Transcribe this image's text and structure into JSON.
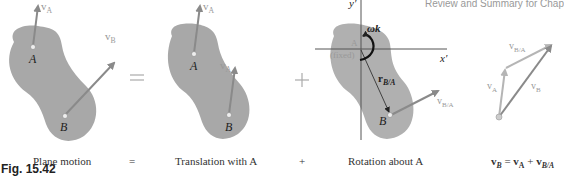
{
  "header": {
    "running_title": "Review and Summary for Chap"
  },
  "figure": {
    "label": "Fig. 15.42",
    "colors": {
      "body_fill": "#a8a8a8",
      "arrow": "#8a8a8a",
      "arrow_light": "#b5b5b5",
      "axis": "#555555",
      "text": "#222222"
    },
    "panels": [
      {
        "id": "plane-motion",
        "caption": "Plane motion",
        "point_a": "A",
        "point_b": "B",
        "vec_a": "v",
        "vec_a_sub": "A",
        "vec_b": "v",
        "vec_b_sub": "B"
      },
      {
        "id": "translation",
        "caption": "Translation with A",
        "point_a": "A",
        "point_b": "B",
        "vec_a": "v",
        "vec_a_sub": "A",
        "vec_b": "v",
        "vec_b_sub": "A"
      },
      {
        "id": "rotation",
        "caption": "Rotation about A",
        "axis_x": "x′",
        "axis_y": "y′",
        "omega": "ωk",
        "point_a": "A",
        "fixed": "(fixed)",
        "r_label": "r",
        "r_sub": "B/A",
        "point_b": "B",
        "vec": "v",
        "vec_sub": "B/A"
      },
      {
        "id": "vector-triangle",
        "caption_lhs": "v",
        "caption_lhs_sub": "B",
        "caption_eq": " = ",
        "caption_t1": "v",
        "caption_t1_sub": "A",
        "caption_plus": " + ",
        "caption_t2": "v",
        "caption_t2_sub": "B/A",
        "vec_a": "v",
        "vec_a_sub": "A",
        "vec_b": "v",
        "vec_b_sub": "B",
        "vec_ba": "v",
        "vec_ba_sub": "B/A"
      }
    ],
    "operators": {
      "equals": "=",
      "plus": "+"
    }
  }
}
